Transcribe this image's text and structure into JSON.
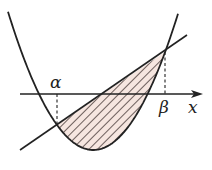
{
  "figure": {
    "type": "area between parabola and line",
    "labels": {
      "alpha": "α",
      "beta": "β",
      "x_axis": "x"
    },
    "colors": {
      "stroke": "#222222",
      "hatch_fill": "#f6e6e0",
      "hatch_line": "#4a3c3a"
    },
    "parabola": {
      "vertex": [
        93.3,
        150
      ],
      "k": 0.019,
      "x_range": [
        8,
        178.5
      ]
    },
    "line": {
      "from": [
        20,
        150
      ],
      "to": [
        187,
        35
      ]
    },
    "intersections": {
      "alpha": [
        57,
        125
      ],
      "beta": [
        165,
        52
      ]
    },
    "axis": {
      "y": 94,
      "x_start": 20,
      "x_end": 202
    }
  }
}
